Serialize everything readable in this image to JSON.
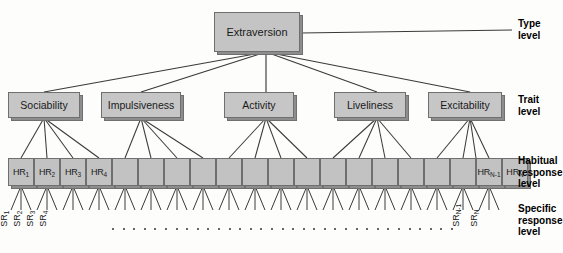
{
  "diagram": {
    "background_color": "#fdfdfb",
    "box_fill_color": "#c6c6c6",
    "box_border_color": "#6f6f6f",
    "line_color": "#3a3a3a"
  },
  "type_level": {
    "label": "Extraversion",
    "caption": "Type\nlevel"
  },
  "trait_level": {
    "caption": "Trait\nlevel",
    "items": [
      {
        "label": "Sociability"
      },
      {
        "label": "Impulsiveness"
      },
      {
        "label": "Activity"
      },
      {
        "label": "Liveliness"
      },
      {
        "label": "Excitability"
      }
    ]
  },
  "habitual_response_level": {
    "caption": "Habitual\nresponse\nlevel",
    "count": 20,
    "items": [
      {
        "base": "HR",
        "sub": "1"
      },
      {
        "base": "HR",
        "sub": "2"
      },
      {
        "base": "HR",
        "sub": "3"
      },
      {
        "base": "HR",
        "sub": "4"
      },
      {
        "base": "",
        "sub": ""
      },
      {
        "base": "",
        "sub": ""
      },
      {
        "base": "",
        "sub": ""
      },
      {
        "base": "",
        "sub": ""
      },
      {
        "base": "",
        "sub": ""
      },
      {
        "base": "",
        "sub": ""
      },
      {
        "base": "",
        "sub": ""
      },
      {
        "base": "",
        "sub": ""
      },
      {
        "base": "",
        "sub": ""
      },
      {
        "base": "",
        "sub": ""
      },
      {
        "base": "",
        "sub": ""
      },
      {
        "base": "",
        "sub": ""
      },
      {
        "base": "",
        "sub": ""
      },
      {
        "base": "",
        "sub": ""
      },
      {
        "base": "HR",
        "sub": "N-1"
      },
      {
        "base": "HR",
        "sub": "N"
      }
    ]
  },
  "specific_response_level": {
    "caption": "Specific\nresponse\nlevel",
    "left_items": [
      {
        "base": "SR",
        "sub": "1"
      },
      {
        "base": "SR",
        "sub": "2"
      },
      {
        "base": "SR",
        "sub": "3"
      },
      {
        "base": "SR",
        "sub": "4"
      }
    ],
    "right_items": [
      {
        "base": "SR",
        "sub": "N-1"
      },
      {
        "base": "SR",
        "sub": "N"
      }
    ],
    "ellipsis_dot_count": 33
  }
}
